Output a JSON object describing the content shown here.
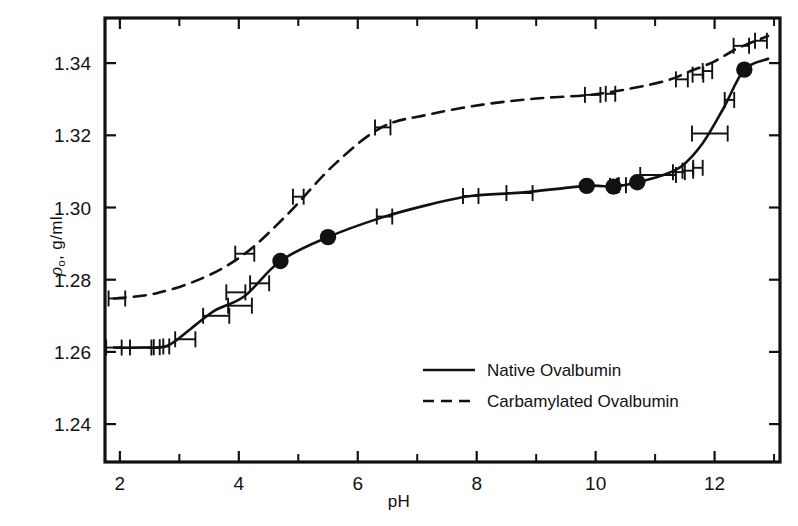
{
  "chart_data": {
    "type": "line",
    "title": "",
    "xlabel": "pH",
    "ylabel": "ρ₀, g/ml",
    "ylabel_symbol": "ρ",
    "ylabel_subscript": "o",
    "ylabel_units": ", g/ml",
    "xlim": [
      1.75,
      13.1
    ],
    "ylim": [
      1.2295,
      1.3525
    ],
    "grid": false,
    "legend_position": "bottom-center",
    "x_ticks_major": [
      2,
      4,
      6,
      8,
      10,
      12
    ],
    "x_ticks_major_labels": [
      "2",
      "4",
      "6",
      "8",
      "10",
      "12"
    ],
    "x_ticks_minor": [
      3,
      5,
      7,
      9,
      11,
      13
    ],
    "y_ticks_major": [
      1.24,
      1.26,
      1.28,
      1.3,
      1.32,
      1.34
    ],
    "y_ticks_major_labels": [
      "1.24",
      "1.26",
      "1.28",
      "1.30",
      "1.32",
      "1.34"
    ],
    "series": [
      {
        "name": "Native Ovalbumin",
        "style": "solid",
        "color": "#111111",
        "x": [
          1.9,
          2.4,
          2.8,
          3.2,
          3.6,
          4.1,
          4.7,
          5.5,
          6.4,
          7.2,
          7.9,
          8.8,
          9.85,
          10.3,
          10.7,
          11.1,
          11.45,
          11.8,
          12.15,
          12.5,
          12.9
        ],
        "y": [
          1.2612,
          1.2612,
          1.2617,
          1.2665,
          1.2715,
          1.2755,
          1.2852,
          1.2918,
          1.2972,
          1.3008,
          1.3032,
          1.3042,
          1.306,
          1.3058,
          1.307,
          1.3088,
          1.3115,
          1.3178,
          1.3275,
          1.3382,
          1.3412
        ]
      },
      {
        "name": "Carbamylated Ovalbumin",
        "style": "dashed",
        "color": "#111111",
        "x": [
          1.9,
          2.6,
          3.4,
          4.1,
          4.8,
          5.6,
          6.4,
          7.2,
          8.1,
          9.0,
          9.9,
          10.6,
          11.2,
          11.6,
          12.0,
          12.4,
          12.9
        ],
        "y": [
          1.2748,
          1.2762,
          1.2805,
          1.2872,
          1.2978,
          1.3118,
          1.3222,
          1.3258,
          1.3285,
          1.3302,
          1.3312,
          1.333,
          1.3352,
          1.3378,
          1.3405,
          1.3442,
          1.3475
        ]
      }
    ],
    "markers": {
      "name": "Native Ovalbumin filled circles",
      "shape": "filled-circle",
      "x": [
        4.7,
        5.5,
        9.85,
        10.3,
        10.7,
        12.5
      ],
      "y": [
        1.2852,
        1.2918,
        1.306,
        1.3058,
        1.307,
        1.3382
      ]
    },
    "error_bars_native": [
      {
        "x": 1.9,
        "y": 1.2612,
        "xerr": 0.13
      },
      {
        "x": 2.35,
        "y": 1.2612,
        "xerr": 0.18
      },
      {
        "x": 2.62,
        "y": 1.2613,
        "xerr": 0.05
      },
      {
        "x": 2.78,
        "y": 1.2615,
        "xerr": 0.05
      },
      {
        "x": 3.1,
        "y": 1.2635,
        "xerr": 0.17
      },
      {
        "x": 3.62,
        "y": 1.27,
        "xerr": 0.22
      },
      {
        "x": 4.02,
        "y": 1.2728,
        "xerr": 0.2
      },
      {
        "x": 3.95,
        "y": 1.2765,
        "xerr": 0.16
      },
      {
        "x": 4.35,
        "y": 1.279,
        "xerr": 0.16
      },
      {
        "x": 6.45,
        "y": 1.2975,
        "xerr": 0.13
      },
      {
        "x": 7.9,
        "y": 1.3032,
        "xerr": 0.13
      },
      {
        "x": 8.72,
        "y": 1.304,
        "xerr": 0.22
      },
      {
        "x": 10.3,
        "y": 1.306,
        "xerr": 0.06
      },
      {
        "x": 10.45,
        "y": 1.3062,
        "xerr": 0.06
      },
      {
        "x": 11.05,
        "y": 1.309,
        "xerr": 0.3
      },
      {
        "x": 11.4,
        "y": 1.3098,
        "xerr": 0.1
      },
      {
        "x": 11.55,
        "y": 1.3102,
        "xerr": 0.09
      },
      {
        "x": 11.72,
        "y": 1.311,
        "xerr": 0.08
      },
      {
        "x": 11.92,
        "y": 1.3205,
        "xerr": 0.3
      },
      {
        "x": 12.25,
        "y": 1.3298,
        "xerr": 0.08
      }
    ],
    "error_bars_carbamylated": [
      {
        "x": 1.95,
        "y": 1.2748,
        "xerr": 0.14
      },
      {
        "x": 4.1,
        "y": 1.2872,
        "xerr": 0.16
      },
      {
        "x": 5.0,
        "y": 1.303,
        "xerr": 0.09
      },
      {
        "x": 6.42,
        "y": 1.3222,
        "xerr": 0.13
      },
      {
        "x": 9.95,
        "y": 1.3312,
        "xerr": 0.13
      },
      {
        "x": 10.25,
        "y": 1.3315,
        "xerr": 0.08
      },
      {
        "x": 11.45,
        "y": 1.3355,
        "xerr": 0.1
      },
      {
        "x": 11.72,
        "y": 1.3368,
        "xerr": 0.09
      },
      {
        "x": 11.88,
        "y": 1.3378,
        "xerr": 0.08
      },
      {
        "x": 12.45,
        "y": 1.3448,
        "xerr": 0.13
      },
      {
        "x": 12.78,
        "y": 1.3462,
        "xerr": 0.1
      }
    ]
  },
  "legend": {
    "entries": [
      {
        "label": "Native Ovalbumin",
        "style": "solid"
      },
      {
        "label": "Carbamylated Ovalbumin",
        "style": "dashed"
      }
    ]
  }
}
